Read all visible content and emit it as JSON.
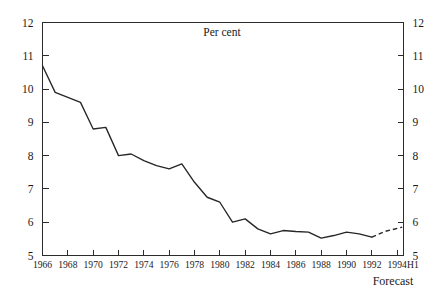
{
  "chart_data": {
    "type": "line",
    "title": "Per cent",
    "xlabel": "",
    "ylabel": "",
    "annotation": "Forecast",
    "x_axis_suffix": "H1",
    "xlim": [
      1966,
      1994.5
    ],
    "ylim": [
      5,
      12
    ],
    "grid": false,
    "legend": "none",
    "y_ticks": [
      "12",
      "11",
      "10",
      "9",
      "8",
      "7",
      "6",
      "5"
    ],
    "y_ticks_right": [
      "12",
      "11",
      "10",
      "9",
      "8",
      "7",
      "6",
      "5"
    ],
    "x_ticks": [
      "1966",
      "1968",
      "1970",
      "1972",
      "1974",
      "1976",
      "1978",
      "1980",
      "1982",
      "1984",
      "1986",
      "1988",
      "1990",
      "1992",
      "1994"
    ],
    "x": [
      1966,
      1967,
      1968,
      1969,
      1970,
      1971,
      1972,
      1973,
      1974,
      1975,
      1976,
      1977,
      1978,
      1979,
      1980,
      1981,
      1982,
      1983,
      1984,
      1985,
      1986,
      1987,
      1988,
      1989,
      1990,
      1991,
      1992
    ],
    "values": [
      10.7,
      9.9,
      9.75,
      9.6,
      8.8,
      8.85,
      8.0,
      8.05,
      7.85,
      7.7,
      7.6,
      7.75,
      7.2,
      6.75,
      6.6,
      6.0,
      6.1,
      5.8,
      5.65,
      5.75,
      5.72,
      5.7,
      5.52,
      5.6,
      5.7,
      5.65,
      5.55
    ],
    "forecast_x": [
      1992,
      1993,
      1994.4
    ],
    "forecast_values": [
      5.55,
      5.72,
      5.85
    ],
    "series_name": "Per cent",
    "line_color": "#262626",
    "axis_color": "#2b2b2b",
    "background_color": "#ffffff"
  }
}
